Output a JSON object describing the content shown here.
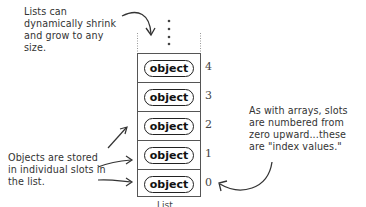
{
  "annotations": {
    "top": "Lists can dynamically shrink and grow to any size.",
    "left": "Objects are stored in individual slots in the list.",
    "right": "As with arrays, slots are numbered from zero upward...these are \"index values.\""
  },
  "list": {
    "slots": [
      {
        "label": "object",
        "index": "4"
      },
      {
        "label": "object",
        "index": "3"
      },
      {
        "label": "object",
        "index": "2"
      },
      {
        "label": "object",
        "index": "1"
      },
      {
        "label": "object",
        "index": "0"
      }
    ],
    "bottom_label": "List"
  }
}
